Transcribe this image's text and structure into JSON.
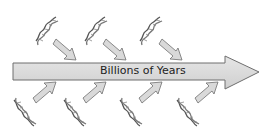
{
  "diagram": {
    "timeline_label": "Billions of Years",
    "colors": {
      "arrow_fill": "#d9d9d9",
      "arrow_stroke": "#6e6e6e",
      "dna": "#555555",
      "background": "#ffffff"
    },
    "dna_above_count": 3,
    "dna_below_count": 4
  }
}
